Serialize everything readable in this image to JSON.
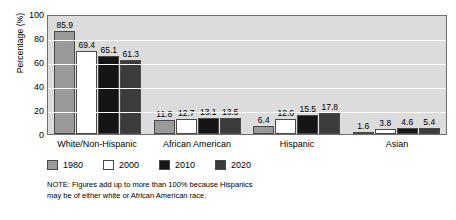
{
  "chart_data": {
    "type": "bar",
    "title": "",
    "xlabel": "",
    "ylabel": "Percentage (%)",
    "ylim": [
      0,
      100
    ],
    "yticks": [
      100,
      80,
      60,
      40,
      20,
      0
    ],
    "grid": true,
    "legend_position": "bottom-left",
    "categories": [
      "White/Non-Hispanic",
      "African American",
      "Hispanic",
      "Asian"
    ],
    "series": [
      {
        "name": "1980",
        "color": "#9a9a9a",
        "values": [
          85.9,
          11.8,
          6.4,
          1.6
        ]
      },
      {
        "name": "2000",
        "color": "#ffffff",
        "values": [
          69.4,
          12.7,
          12.6,
          3.8
        ]
      },
      {
        "name": "2010",
        "color": "#151515",
        "values": [
          65.1,
          13.1,
          15.5,
          4.6
        ]
      },
      {
        "name": "2020",
        "color": "#3c3c3c",
        "values": [
          61.3,
          13.5,
          17.8,
          5.4
        ]
      }
    ],
    "note": {
      "line1": "NOTE: Figures add up to more than 100% because Hispanics",
      "line2": "may be of either white or African American race."
    },
    "plot_background": "#dcdcdc",
    "gridline_color": "#ffffff"
  }
}
